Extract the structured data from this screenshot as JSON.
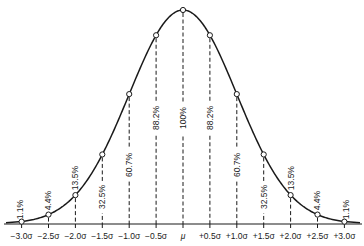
{
  "chart_data": {
    "type": "line",
    "title": "",
    "xlabel": "",
    "ylabel": "",
    "x": [
      -3.0,
      -2.5,
      -2.0,
      -1.5,
      -1.0,
      -0.5,
      0,
      0.5,
      1.0,
      1.5,
      2.0,
      2.5,
      3.0
    ],
    "tick_labels": [
      "−3.0σ",
      "−2.5σ",
      "−2.0σ",
      "−1.5σ",
      "−1.0σ",
      "−0.5σ",
      "μ",
      "+0.5σ",
      "+1.0σ",
      "+1.5σ",
      "+2.0σ",
      "+2.5σ",
      "+3.0σ"
    ],
    "series": [
      {
        "name": "Relative ordinate height (% of peak)",
        "values": [
          1.1,
          4.4,
          13.5,
          32.5,
          60.7,
          88.2,
          100,
          88.2,
          60.7,
          32.5,
          13.5,
          4.4,
          1.1
        ],
        "labels": [
          "1.1%",
          "4.4%",
          "13.5%",
          "32.5%",
          "60.7%",
          "88.2%",
          "100%",
          "88.2%",
          "60.7%",
          "32.5%",
          "13.5%",
          "4.4%",
          "1.1%"
        ]
      }
    ],
    "xlim": [
      -3.0,
      3.0
    ],
    "ylim": [
      0,
      100
    ],
    "grid": false,
    "legend": "none",
    "dashed_ordinates": true,
    "markers": "open-circle",
    "colors": {
      "curve": "#1a1a1a",
      "background": "#ffffff"
    }
  }
}
